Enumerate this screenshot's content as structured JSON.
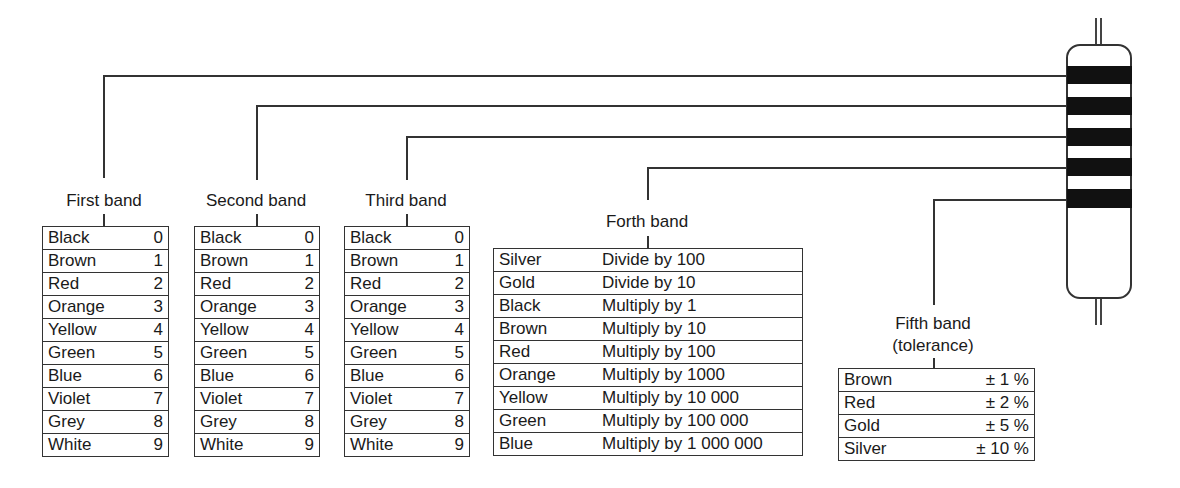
{
  "diagram": {
    "bands": [
      {
        "label": "First band",
        "rows": [
          [
            "Black",
            "0"
          ],
          [
            "Brown",
            "1"
          ],
          [
            "Red",
            "2"
          ],
          [
            "Orange",
            "3"
          ],
          [
            "Yellow",
            "4"
          ],
          [
            "Green",
            "5"
          ],
          [
            "Blue",
            "6"
          ],
          [
            "Violet",
            "7"
          ],
          [
            "Grey",
            "8"
          ],
          [
            "White",
            "9"
          ]
        ]
      },
      {
        "label": "Second band",
        "rows": [
          [
            "Black",
            "0"
          ],
          [
            "Brown",
            "1"
          ],
          [
            "Red",
            "2"
          ],
          [
            "Orange",
            "3"
          ],
          [
            "Yellow",
            "4"
          ],
          [
            "Green",
            "5"
          ],
          [
            "Blue",
            "6"
          ],
          [
            "Violet",
            "7"
          ],
          [
            "Grey",
            "8"
          ],
          [
            "White",
            "9"
          ]
        ]
      },
      {
        "label": "Third band",
        "rows": [
          [
            "Black",
            "0"
          ],
          [
            "Brown",
            "1"
          ],
          [
            "Red",
            "2"
          ],
          [
            "Orange",
            "3"
          ],
          [
            "Yellow",
            "4"
          ],
          [
            "Green",
            "5"
          ],
          [
            "Blue",
            "6"
          ],
          [
            "Violet",
            "7"
          ],
          [
            "Grey",
            "8"
          ],
          [
            "White",
            "9"
          ]
        ]
      },
      {
        "label": "Forth band",
        "rows": [
          [
            "Silver",
            "Divide by 100"
          ],
          [
            "Gold",
            "Divide by 10"
          ],
          [
            "Black",
            "Multiply by 1"
          ],
          [
            "Brown",
            "Multiply by 10"
          ],
          [
            "Red",
            "Multiply by 100"
          ],
          [
            "Orange",
            "Multiply by 1000"
          ],
          [
            "Yellow",
            "Multiply by 10 000"
          ],
          [
            "Green",
            "Multiply by 100 000"
          ],
          [
            "Blue",
            "Multiply by 1 000 000"
          ]
        ]
      },
      {
        "label_line1": "Fifth band",
        "label_line2": "(tolerance)",
        "rows": [
          [
            "Brown",
            "± 1 %"
          ],
          [
            "Red",
            "± 2 %"
          ],
          [
            "Gold",
            "± 5 %"
          ],
          [
            "Silver",
            "± 10 %"
          ]
        ]
      }
    ],
    "resistor": {
      "stripe_count": 5,
      "stripe_color": "#111111",
      "body_color": "#ffffff"
    }
  }
}
